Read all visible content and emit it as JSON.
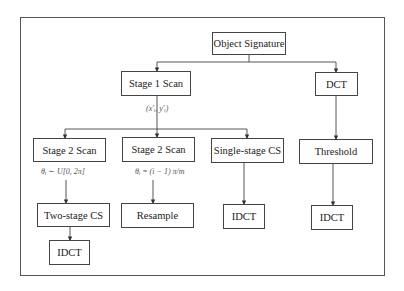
{
  "diagram": {
    "nodes": {
      "object_signature": "Object Signature",
      "stage1_scan": "Stage 1 Scan",
      "dct": "DCT",
      "stage2_scan_random": "Stage 2 Scan",
      "stage2_scan_uniform": "Stage 2 Scan",
      "single_stage_cs": "Single-stage CS",
      "threshold": "Threshold",
      "two_stage_cs": "Two-stage CS",
      "resample": "Resample",
      "idct_single": "IDCT",
      "idct_threshold": "IDCT",
      "idct_two_stage": "IDCT"
    },
    "edge_labels": {
      "stage1_output": "(x′ᵢ, y′ᵢ)",
      "random_angle": "θᵢ ∼ U[0, 2π]",
      "uniform_angle": "θᵢ = (i − 1) π/m"
    },
    "edges": [
      [
        "Object Signature",
        "Stage 1 Scan"
      ],
      [
        "Object Signature",
        "DCT"
      ],
      [
        "Stage 1 Scan",
        "Stage 2 Scan"
      ],
      [
        "Stage 1 Scan",
        "Stage 2 Scan"
      ],
      [
        "Stage 1 Scan",
        "Single-stage CS"
      ],
      [
        "DCT",
        "Threshold"
      ],
      [
        "Stage 2 Scan",
        "Two-stage CS"
      ],
      [
        "Stage 2 Scan",
        "Resample"
      ],
      [
        "Single-stage CS",
        "IDCT"
      ],
      [
        "Threshold",
        "IDCT"
      ],
      [
        "Two-stage CS",
        "IDCT"
      ]
    ]
  }
}
